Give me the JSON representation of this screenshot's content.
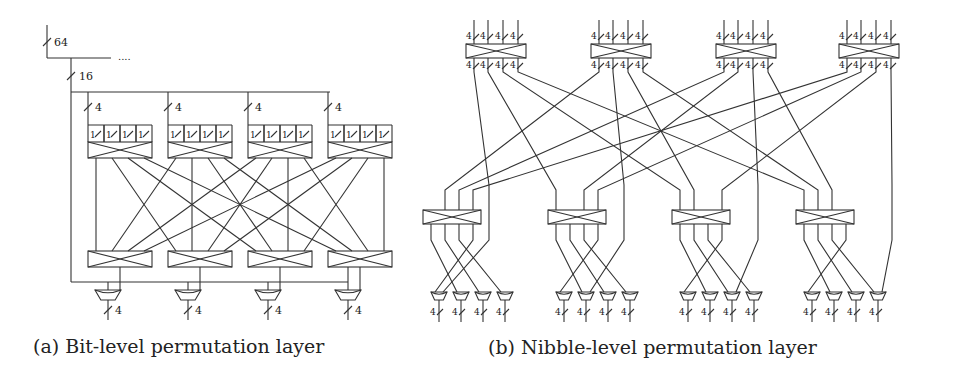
{
  "figure": {
    "panel_a": {
      "caption": "(a) Bit-level permutation layer",
      "bus_labels": {
        "input": "64",
        "split": "16",
        "group": "4",
        "bit": "1",
        "output": "4"
      },
      "continuation": "....",
      "top_boxes": 4,
      "bottom_boxes": 4,
      "muxes": 4
    },
    "panel_b": {
      "caption": "(b) Nibble-level permutation layer",
      "bus_labels": {
        "nibble": "4"
      },
      "top_boxes": 4,
      "middle_boxes": 4,
      "muxes": 16
    },
    "colors": {
      "line": "#333333",
      "background": "#ffffff"
    }
  }
}
